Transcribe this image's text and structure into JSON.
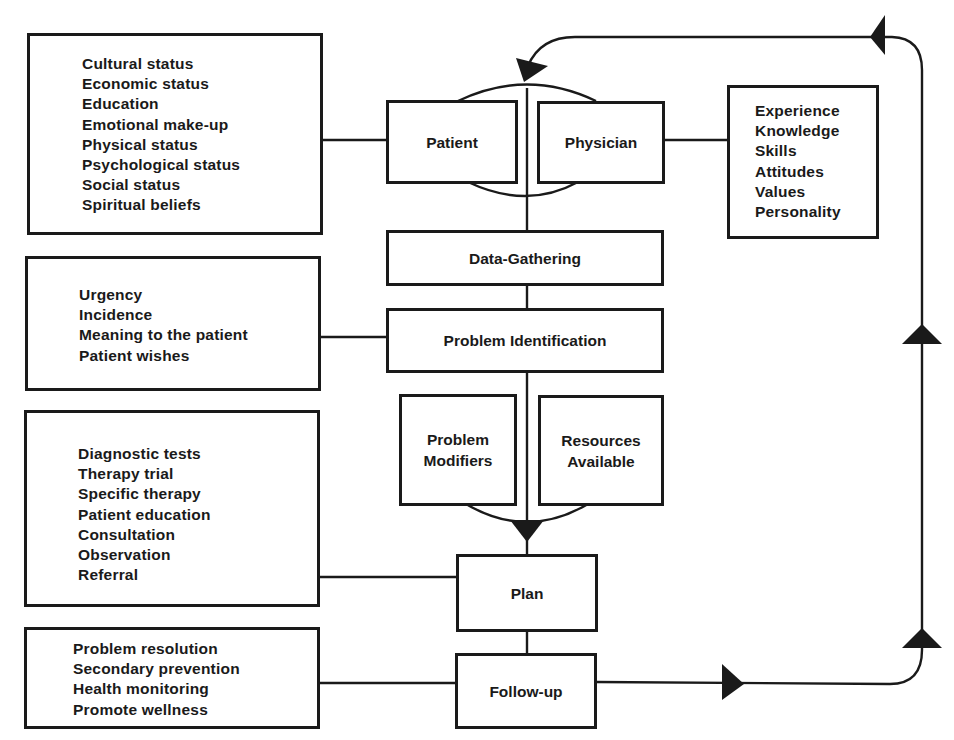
{
  "diagram": {
    "type": "flowchart",
    "nodes": {
      "patient": "Patient",
      "physician": "Physician",
      "data_gathering": "Data-Gathering",
      "problem_identification": "Problem Identification",
      "problem_modifiers": "Problem Modifiers",
      "resources_available": "Resources Available",
      "problem_modifiers_lines": [
        "Problem",
        "Modifiers"
      ],
      "resources_available_lines": [
        "Resources",
        "Available"
      ],
      "plan": "Plan",
      "follow_up": "Follow-up"
    },
    "side_boxes": {
      "patient_factors": [
        "Cultural status",
        "Economic status",
        "Education",
        "Emotional make-up",
        "Physical status",
        "Psychological status",
        "Social status",
        "Spiritual beliefs"
      ],
      "physician_factors": [
        "Experience",
        "Knowledge",
        "Skills",
        "Attitudes",
        "Values",
        "Personality"
      ],
      "problem_identification_factors": [
        "Urgency",
        "Incidence",
        "Meaning to the patient",
        "Patient wishes"
      ],
      "plan_options": [
        "Diagnostic tests",
        "Therapy trial",
        "Specific therapy",
        "Patient education",
        "Consultation",
        "Observation",
        "Referral"
      ],
      "follow_up_goals": [
        "Problem resolution",
        "Secondary prevention",
        "Health monitoring",
        "Promote wellness"
      ]
    },
    "edges": [
      {
        "from": "Patient + Physician",
        "to": "Data-Gathering"
      },
      {
        "from": "Data-Gathering",
        "to": "Problem Identification"
      },
      {
        "from": "Problem Identification",
        "to": "Plan",
        "via": [
          "Problem Modifiers",
          "Resources Available"
        ]
      },
      {
        "from": "Plan",
        "to": "Follow-up"
      },
      {
        "from": "Follow-up",
        "to": "Patient + Physician",
        "label": "feedback loop"
      }
    ],
    "colors": {
      "ink": "#1a1a1a",
      "background": "#ffffff"
    }
  }
}
